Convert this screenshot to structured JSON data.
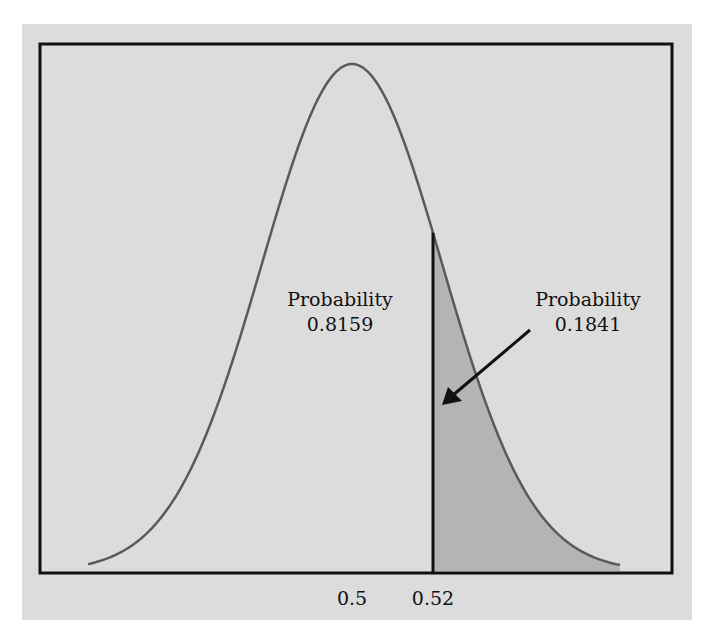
{
  "chart_data": {
    "type": "area",
    "title": "",
    "xlabel": "",
    "ylabel": "",
    "distribution": "normal",
    "mean": 0.5,
    "x_ticks": [
      "0.5",
      "0.52"
    ],
    "cutoff": 0.52,
    "regions": [
      {
        "name": "left",
        "label": "Probability",
        "value": "0.8159"
      },
      {
        "name": "right",
        "label": "Probability",
        "value": "0.1841",
        "shaded": true
      }
    ],
    "grid": false,
    "legend": "none"
  },
  "annotations": {
    "left_title": "Probability",
    "left_value": "0.8159",
    "right_title": "Probability",
    "right_value": "0.1841"
  },
  "axis": {
    "tick_mean": "0.5",
    "tick_cutoff": "0.52"
  },
  "colors": {
    "panel": "#dcdcdc",
    "curve": "#5a5a5a",
    "shade": "#b4b4b4",
    "frame": "#111111"
  }
}
